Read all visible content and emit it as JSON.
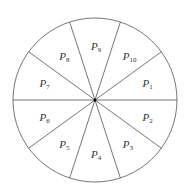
{
  "diagram": {
    "type": "circle-sectors",
    "sector_count": 10,
    "sectors": [
      {
        "letter": "P",
        "index": "1"
      },
      {
        "letter": "P",
        "index": "2"
      },
      {
        "letter": "P",
        "index": "3"
      },
      {
        "letter": "P",
        "index": "4"
      },
      {
        "letter": "P",
        "index": "5"
      },
      {
        "letter": "P",
        "index": "6"
      },
      {
        "letter": "P",
        "index": "7"
      },
      {
        "letter": "P",
        "index": "8"
      },
      {
        "letter": "P",
        "index": "9"
      },
      {
        "letter": "P",
        "index": "10"
      }
    ],
    "stroke_color": "#555555",
    "center_dot_color": "#000000"
  }
}
